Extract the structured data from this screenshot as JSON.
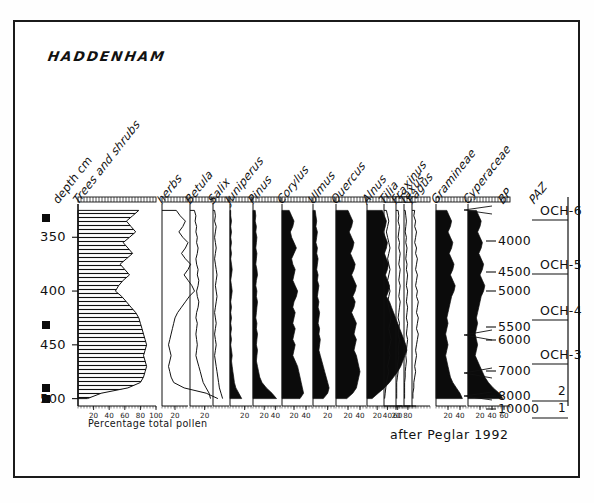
{
  "figure": {
    "site_title": "HADDENHAM",
    "attribution": "after Peglar 1992",
    "percentage_caption": "Percentage total pollen",
    "bp_header": "BP",
    "paz_header": "PAZ"
  },
  "axes": {
    "depth_label": "depth cm",
    "depth_ticks": [
      "350",
      "400",
      "450",
      "500"
    ],
    "depth_min_cm": 320,
    "depth_max_cm": 505
  },
  "columns": [
    {
      "name": "Trees and shrubs",
      "style": "hatched",
      "ticks": [
        "20",
        "40",
        "60",
        "80",
        "100"
      ],
      "max": 100
    },
    {
      "name": "herbs",
      "style": "line",
      "ticks": [
        "20"
      ],
      "max": 40
    },
    {
      "name": "Betula",
      "style": "line",
      "ticks": [
        "20"
      ],
      "max": 30
    },
    {
      "name": "Salix",
      "style": "line",
      "ticks": [],
      "max": 20
    },
    {
      "name": "Juniperus",
      "style": "filled",
      "ticks": [
        "20"
      ],
      "max": 30
    },
    {
      "name": "Pinus",
      "style": "filled",
      "ticks": [
        "20",
        "40"
      ],
      "max": 50
    },
    {
      "name": "Corylus",
      "style": "filled",
      "ticks": [
        "20",
        "40"
      ],
      "max": 50
    },
    {
      "name": "Ulmus",
      "style": "filled",
      "ticks": [
        "20"
      ],
      "max": 30
    },
    {
      "name": "Quercus",
      "style": "filled",
      "ticks": [
        "20",
        "40"
      ],
      "max": 50
    },
    {
      "name": "Alnus",
      "style": "filled",
      "ticks": [
        "20",
        "40",
        "60",
        "80"
      ],
      "max": 90
    },
    {
      "name": "Tilia",
      "style": "line",
      "ticks": [
        "20"
      ],
      "max": 30
    },
    {
      "name": "Fraxinus",
      "style": "line",
      "ticks": [],
      "max": 20
    },
    {
      "name": "Taxus",
      "style": "line",
      "ticks": [],
      "max": 20
    },
    {
      "name": "Fagus",
      "style": "line",
      "ticks": [],
      "max": 20
    },
    {
      "name": "Gramineae",
      "style": "filled",
      "ticks": [
        "20",
        "40"
      ],
      "max": 50
    },
    {
      "name": "Cyperaceae",
      "style": "filled",
      "ticks": [
        "20",
        "40",
        "60"
      ],
      "max": 70
    }
  ],
  "bp_dates": [
    {
      "label": "4000",
      "y": 241
    },
    {
      "label": "4500",
      "y": 272
    },
    {
      "label": "5000",
      "y": 291
    },
    {
      "label": "5500",
      "y": 327
    },
    {
      "label": "6000",
      "y": 340
    },
    {
      "label": "7000",
      "y": 371
    },
    {
      "label": "8000",
      "y": 396
    },
    {
      "label": "10000",
      "y": 409
    }
  ],
  "paz_zones": [
    {
      "label": "OCH-6",
      "y": 211
    },
    {
      "label": "OCH-5",
      "y": 265
    },
    {
      "label": "OCH-4",
      "y": 311
    },
    {
      "label": "OCH-3",
      "y": 355
    },
    {
      "label": "2",
      "y": 392
    },
    {
      "label": "1",
      "y": 409
    }
  ],
  "chart_data": {
    "type": "area",
    "title": "HADDENHAM",
    "xlabel": "Percentage total pollen",
    "ylabel": "depth cm",
    "ylim": [
      505,
      320
    ],
    "grid": false,
    "legend": "none",
    "depths": [
      325,
      330,
      335,
      340,
      345,
      350,
      355,
      360,
      365,
      370,
      375,
      380,
      385,
      390,
      395,
      400,
      405,
      410,
      415,
      420,
      425,
      430,
      435,
      440,
      445,
      450,
      455,
      460,
      465,
      470,
      475,
      480,
      485,
      490,
      495,
      500
    ],
    "series": [
      {
        "name": "Trees and shrubs",
        "max": 100,
        "values": [
          78,
          70,
          62,
          68,
          74,
          66,
          58,
          64,
          70,
          62,
          54,
          60,
          66,
          58,
          52,
          48,
          56,
          62,
          68,
          74,
          78,
          80,
          82,
          84,
          86,
          88,
          86,
          84,
          86,
          88,
          86,
          84,
          80,
          64,
          30,
          12
        ]
      },
      {
        "name": "herbs",
        "max": 40,
        "values": [
          22,
          28,
          36,
          32,
          26,
          32,
          40,
          36,
          30,
          36,
          44,
          40,
          34,
          40,
          46,
          50,
          42,
          36,
          30,
          24,
          20,
          18,
          16,
          14,
          12,
          10,
          12,
          14,
          12,
          10,
          12,
          14,
          18,
          34,
          68,
          86
        ]
      },
      {
        "name": "Betula",
        "max": 30,
        "values": [
          6,
          8,
          7,
          9,
          8,
          10,
          9,
          11,
          10,
          8,
          9,
          11,
          10,
          12,
          11,
          9,
          10,
          12,
          11,
          9,
          8,
          10,
          9,
          8,
          9,
          10,
          9,
          8,
          10,
          12,
          14,
          16,
          18,
          22,
          26,
          28
        ]
      },
      {
        "name": "Salix",
        "max": 20,
        "values": [
          2,
          3,
          2,
          4,
          3,
          2,
          3,
          4,
          3,
          2,
          3,
          4,
          5,
          4,
          3,
          4,
          5,
          4,
          3,
          2,
          3,
          4,
          3,
          2,
          3,
          4,
          3,
          2,
          3,
          4,
          5,
          6,
          7,
          8,
          10,
          12
        ]
      },
      {
        "name": "Juniperus",
        "max": 30,
        "values": [
          1,
          1,
          2,
          1,
          2,
          1,
          2,
          1,
          2,
          1,
          2,
          3,
          2,
          1,
          2,
          3,
          2,
          1,
          2,
          1,
          2,
          1,
          2,
          1,
          2,
          1,
          2,
          3,
          2,
          3,
          4,
          5,
          6,
          8,
          12,
          16
        ]
      },
      {
        "name": "Pinus",
        "max": 50,
        "values": [
          4,
          5,
          4,
          6,
          5,
          7,
          6,
          5,
          7,
          6,
          5,
          7,
          8,
          6,
          5,
          7,
          6,
          8,
          7,
          6,
          5,
          7,
          6,
          8,
          7,
          6,
          8,
          7,
          6,
          8,
          10,
          12,
          16,
          24,
          34,
          42
        ]
      },
      {
        "name": "Corylus",
        "max": 50,
        "values": [
          12,
          16,
          20,
          18,
          14,
          16,
          20,
          24,
          20,
          16,
          18,
          22,
          20,
          18,
          22,
          26,
          24,
          20,
          18,
          22,
          20,
          18,
          22,
          20,
          18,
          22,
          20,
          18,
          22,
          26,
          28,
          30,
          32,
          34,
          36,
          30
        ]
      },
      {
        "name": "Ulmus",
        "max": 30,
        "values": [
          3,
          4,
          5,
          4,
          6,
          5,
          4,
          6,
          5,
          7,
          6,
          5,
          7,
          6,
          8,
          7,
          6,
          8,
          7,
          9,
          8,
          7,
          9,
          8,
          10,
          9,
          8,
          10,
          12,
          14,
          16,
          18,
          20,
          22,
          20,
          14
        ]
      },
      {
        "name": "Quercus",
        "max": 50,
        "values": [
          20,
          24,
          28,
          26,
          22,
          26,
          30,
          28,
          24,
          28,
          32,
          30,
          26,
          30,
          34,
          32,
          28,
          32,
          30,
          26,
          30,
          34,
          32,
          30,
          34,
          32,
          30,
          34,
          36,
          38,
          40,
          38,
          36,
          34,
          28,
          18
        ]
      },
      {
        "name": "Alnus",
        "max": 90,
        "values": [
          30,
          34,
          38,
          36,
          32,
          36,
          40,
          38,
          34,
          38,
          42,
          40,
          36,
          40,
          44,
          42,
          38,
          44,
          48,
          52,
          56,
          60,
          64,
          68,
          72,
          76,
          78,
          74,
          70,
          66,
          60,
          52,
          44,
          34,
          22,
          10
        ]
      },
      {
        "name": "Tilia",
        "max": 30,
        "values": [
          4,
          6,
          8,
          6,
          4,
          6,
          8,
          10,
          8,
          6,
          8,
          10,
          8,
          6,
          8,
          10,
          8,
          6,
          8,
          10,
          12,
          10,
          8,
          10,
          12,
          10,
          8,
          10,
          8,
          6,
          8,
          6,
          4,
          3,
          2,
          1
        ]
      },
      {
        "name": "Fraxinus",
        "max": 20,
        "values": [
          3,
          4,
          3,
          5,
          4,
          3,
          5,
          4,
          6,
          5,
          4,
          6,
          5,
          4,
          6,
          5,
          4,
          6,
          5,
          4,
          3,
          5,
          4,
          3,
          5,
          4,
          3,
          4,
          3,
          2,
          3,
          2,
          1,
          1,
          1,
          1
        ]
      },
      {
        "name": "Taxus",
        "max": 20,
        "values": [
          2,
          3,
          4,
          3,
          2,
          4,
          3,
          5,
          4,
          3,
          5,
          4,
          6,
          5,
          4,
          6,
          5,
          4,
          6,
          5,
          4,
          6,
          5,
          4,
          6,
          5,
          4,
          3,
          4,
          3,
          2,
          2,
          1,
          1,
          1,
          1
        ]
      },
      {
        "name": "Fagus",
        "max": 20,
        "values": [
          3,
          2,
          4,
          3,
          5,
          4,
          3,
          5,
          4,
          6,
          5,
          4,
          6,
          5,
          4,
          6,
          5,
          7,
          6,
          5,
          7,
          6,
          5,
          7,
          6,
          5,
          4,
          5,
          4,
          3,
          4,
          3,
          2,
          2,
          1,
          1
        ]
      },
      {
        "name": "Gramineae",
        "max": 50,
        "values": [
          18,
          22,
          26,
          24,
          20,
          24,
          28,
          26,
          22,
          26,
          30,
          28,
          24,
          28,
          32,
          30,
          26,
          24,
          22,
          20,
          18,
          20,
          18,
          16,
          18,
          20,
          18,
          16,
          18,
          20,
          22,
          24,
          28,
          34,
          40,
          44
        ]
      },
      {
        "name": "Cyperaceae",
        "max": 70,
        "values": [
          14,
          18,
          22,
          20,
          16,
          20,
          24,
          22,
          18,
          22,
          26,
          24,
          20,
          24,
          28,
          26,
          22,
          20,
          18,
          16,
          14,
          16,
          14,
          12,
          14,
          16,
          14,
          12,
          16,
          20,
          24,
          28,
          34,
          42,
          52,
          58
        ]
      }
    ]
  }
}
